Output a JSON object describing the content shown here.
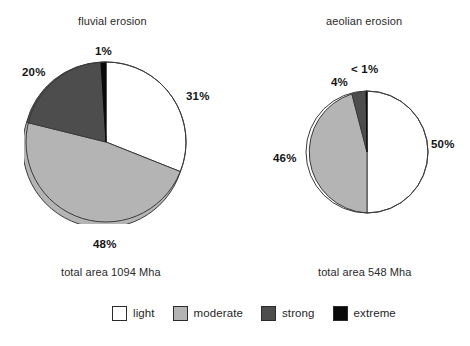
{
  "chart_data": [
    {
      "type": "pie",
      "title": "fluvial erosion",
      "subtitle": "total area 1094 Mha",
      "total_area_value": 1094,
      "total_area_unit": "Mha",
      "categories": [
        "light",
        "moderate",
        "strong",
        "extreme"
      ],
      "values": [
        31,
        48,
        20,
        1
      ],
      "value_labels": [
        "31%",
        "48%",
        "20%",
        "1%"
      ],
      "colors": [
        "#ffffff",
        "#b4b4b4",
        "#4d4d4d",
        "#0a0a0a"
      ],
      "start_angle_deg": 0,
      "direction": "clockwise",
      "center": [
        106,
        142
      ],
      "radius": 80,
      "xlabel": "",
      "ylabel": "",
      "grid": false
    },
    {
      "type": "pie",
      "title": "aeolian erosion",
      "subtitle": "total area 548 Mha",
      "total_area_value": 548,
      "total_area_unit": "Mha",
      "categories": [
        "light",
        "moderate",
        "strong",
        "extreme"
      ],
      "values": [
        50,
        46,
        4,
        0.4
      ],
      "value_labels": [
        "50%",
        "46%",
        "4%",
        "< 1%"
      ],
      "colors": [
        "#ffffff",
        "#b4b4b4",
        "#4d4d4d",
        "#0a0a0a"
      ],
      "start_angle_deg": 0,
      "direction": "clockwise",
      "center": [
        366,
        151
      ],
      "radius": 61,
      "xlabel": "",
      "ylabel": "",
      "grid": false
    }
  ],
  "legend": {
    "position": "bottom-center",
    "items": [
      {
        "label": "light",
        "color": "#ffffff",
        "swatch_name": "legend-swatch-light"
      },
      {
        "label": "moderate",
        "color": "#b4b4b4",
        "swatch_name": "legend-swatch-moderate"
      },
      {
        "label": "strong",
        "color": "#4d4d4d",
        "swatch_name": "legend-swatch-strong"
      },
      {
        "label": "extreme",
        "color": "#0a0a0a",
        "swatch_name": "legend-swatch-extreme"
      }
    ]
  },
  "labels": {
    "fluvial": {
      "title": "fluvial erosion",
      "total": "total area 1094 Mha",
      "extreme": "1%",
      "strong": "20%",
      "light": "31%",
      "moderate": "48%"
    },
    "aeolian": {
      "title": "aeolian erosion",
      "total": "total area 548 Mha",
      "extreme": "< 1%",
      "strong": "4%",
      "light": "50%",
      "moderate": "46%"
    }
  }
}
